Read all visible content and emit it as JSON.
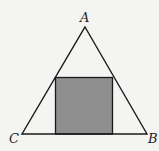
{
  "diagram": {
    "type": "geometry",
    "vertices": {
      "A": {
        "label": "A",
        "x": 85,
        "y": 27
      },
      "B": {
        "label": "B",
        "x": 147,
        "y": 134
      },
      "C": {
        "label": "C",
        "x": 22,
        "y": 134
      }
    },
    "square": {
      "x": 55.5,
      "y": 77.5,
      "size": 57,
      "fill": "#8f8f8f"
    },
    "colors": {
      "stroke": "#1a1a1a",
      "background": "#f4f4f2",
      "shade": "#8f8f8f"
    }
  }
}
